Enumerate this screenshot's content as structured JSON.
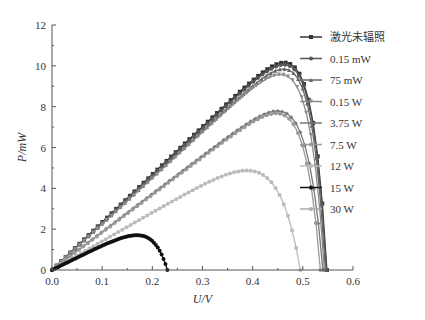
{
  "chart_data": {
    "type": "line",
    "title": "",
    "xlabel": "U/V",
    "ylabel": "P/mW",
    "xlim": [
      0.0,
      0.6
    ],
    "ylim": [
      0,
      12
    ],
    "xticks": [
      "0.0",
      "0.1",
      "0.2",
      "0.3",
      "0.4",
      "0.5",
      "0.6"
    ],
    "yticks": [
      "0",
      "2",
      "4",
      "6",
      "8",
      "10",
      "12"
    ],
    "grid": false,
    "legend_position": "right",
    "series": [
      {
        "name": "激光未辐照",
        "color": "#333333",
        "marker": "square",
        "voc": 0.548,
        "pmax": 10.1,
        "vmp": 0.45
      },
      {
        "name": "0.15 mW",
        "color": "#555555",
        "marker": "circle",
        "voc": 0.547,
        "pmax": 10.0,
        "vmp": 0.45
      },
      {
        "name": "75 mW",
        "color": "#666666",
        "marker": "triangle-up",
        "voc": 0.545,
        "pmax": 9.8,
        "vmp": 0.45
      },
      {
        "name": "0.15 W",
        "color": "#8a8a8a",
        "marker": "triangle-down",
        "voc": 0.543,
        "pmax": 9.5,
        "vmp": 0.44
      },
      {
        "name": "3.75 W",
        "color": "#777777",
        "marker": "diamond",
        "voc": 0.54,
        "pmax": 7.7,
        "vmp": 0.43
      },
      {
        "name": "7.5 W",
        "color": "#999999",
        "marker": "triangle-left",
        "voc": 0.535,
        "pmax": 7.6,
        "vmp": 0.43
      },
      {
        "name": "12 W",
        "color": "#bbbbbb",
        "marker": "triangle-right",
        "voc": 0.495,
        "pmax": 4.6,
        "vmp": 0.34
      },
      {
        "name": "15 W",
        "color": "#111111",
        "marker": "hexagon",
        "voc": 0.23,
        "pmax": 1.4,
        "vmp": 0.12
      },
      {
        "name": "30 W",
        "color": "#aaaaaa",
        "marker": "star",
        "voc": 0.0,
        "pmax": 0.0,
        "vmp": 0.0
      }
    ]
  }
}
